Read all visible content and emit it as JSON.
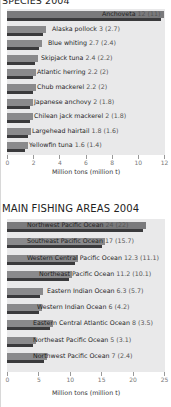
{
  "chart_data": [
    {
      "type": "bar",
      "orientation": "horizontal",
      "title": "SPECIES 2004",
      "xlabel": "Million tons (million t)",
      "ylabel": "",
      "xlim": [
        0,
        12
      ],
      "xticks": [
        0,
        2,
        4,
        6,
        8,
        10,
        12
      ],
      "grid": false,
      "categories": [
        "Anchoveta",
        "Alaska pollock",
        "Blue whiting",
        "Skipjack tuna",
        "Atlantic herring",
        "Chub mackerel",
        "Japanese anchovy",
        "Chilean jack mackerel",
        "Largehead hairtail",
        "Yellowfin tuna"
      ],
      "series": [
        {
          "name": "Million tons",
          "values": [
            12,
            3,
            2.7,
            2.4,
            2.2,
            2.2,
            2,
            2,
            1.8,
            1.6
          ]
        },
        {
          "name": "Million t (parenthetical)",
          "values": [
            11,
            2.7,
            2.4,
            2.2,
            2,
            2,
            1.8,
            1.8,
            1.6,
            1.4
          ]
        }
      ],
      "labels": [
        "Anchoveta 12 (11)",
        "Alaska pollock 3 (2.7)",
        "Blue whiting 2.7 (2.4)",
        "Skipjack tuna 2.4 (2.2)",
        "Atlantic herring 2.2 (2)",
        "Chub mackerel 2.2 (2)",
        "Japanese anchovy 2 (1.8)",
        "Chilean jack mackerel 2 (1.8)",
        "Largehead hairtail 1.8 (1.6)",
        "Yellowfin tuna 1.6 (1.4)"
      ]
    },
    {
      "type": "bar",
      "orientation": "horizontal",
      "title": "MAIN FISHING AREAS 2004",
      "xlabel": "Million tons (million t)",
      "ylabel": "",
      "xlim": [
        0,
        25
      ],
      "xticks": [
        0,
        5,
        10,
        15,
        20,
        25
      ],
      "grid": false,
      "categories": [
        "Northwest Pacific Ocean",
        "Southeast Pacific Ocean",
        "Western Central Pacific Ocean",
        "Northeast Pacific Ocean",
        "Eastern Indian Ocean",
        "Western Indian Ocean",
        "Eastern Central Atlantic Ocean",
        "Northeast Pacific Ocean",
        "Northwest Pacific Ocean"
      ],
      "series": [
        {
          "name": "Million tons",
          "values": [
            24,
            17,
            12.3,
            11.2,
            6.3,
            6,
            8,
            5,
            7
          ]
        },
        {
          "name": "Million t (parenthetical)",
          "values": [
            22,
            15.7,
            11.1,
            10.1,
            5.7,
            4.2,
            3.5,
            3.1,
            2.4
          ]
        }
      ],
      "labels": [
        "Northwest Pacific Ocean 24 (22)",
        "Southeast Pacific Ocean 17 (15.7)",
        "Western Central Pacific Ocean 12.3 (11.1)",
        "Northeast Pacific Ocean 11.2 (10.1)",
        "Eastern Indian Ocean 6.3 (5.7)",
        "Western Indian Ocean 6 (4.2)",
        "Eastern Central Atlantic Ocean 8 (3.5)",
        "Northeast Pacific Ocean 5 (3.1)",
        "Northwest Pacific Ocean 7 (2.4)"
      ]
    }
  ],
  "charts": {
    "species": {
      "title": "SPECIES 2004",
      "xlabel": "Million tons (million t)",
      "ticks": [
        "0",
        "2",
        "4",
        "6",
        "8",
        "10",
        "12"
      ],
      "rows": [
        {
          "name": "Anchoveta",
          "val": "12 (11)"
        },
        {
          "name": "Alaska pollock",
          "val": "3 (2.7)"
        },
        {
          "name": "Blue whiting",
          "val": "2.7 (2.4)"
        },
        {
          "name": "Skipjack tuna",
          "val": "2.4 (2.2)"
        },
        {
          "name": "Atlantic herring",
          "val": "2.2 (2)"
        },
        {
          "name": "Chub mackerel",
          "val": "2.2 (2)"
        },
        {
          "name": "Japanese anchovy",
          "val": "2 (1.8)"
        },
        {
          "name": "Chilean jack mackerel",
          "val": "2 (1.8)"
        },
        {
          "name": "Largehead hairtail",
          "val": "1.8 (1.6)"
        },
        {
          "name": "Yellowfin tuna",
          "val": "1.6 (1.4)"
        }
      ]
    },
    "areas": {
      "title": "MAIN FISHING AREAS 2004",
      "xlabel": "Million tons (million t)",
      "ticks": [
        "0",
        "5",
        "10",
        "15",
        "20",
        "25"
      ],
      "rows": [
        {
          "name": "Northwest Pacific Ocean",
          "val": "24 (22)"
        },
        {
          "name": "Southeast Pacific Ocean",
          "val": "17 (15.7)"
        },
        {
          "name": "Western Central Pacific Ocean",
          "val": "12.3 (11.1)"
        },
        {
          "name": "Northeast Pacific Ocean",
          "val": "11.2 (10.1)"
        },
        {
          "name": "Eastern Indian Ocean",
          "val": "6.3 (5.7)"
        },
        {
          "name": "Western Indian Ocean",
          "val": "6 (4.2)"
        },
        {
          "name": "Eastern Central Atlantic Ocean",
          "val": "8 (3.5)"
        },
        {
          "name": "Northeast Pacific Ocean",
          "val": "5 (3.1)"
        },
        {
          "name": "Northwest Pacific Ocean",
          "val": "7 (2.4)"
        }
      ]
    }
  }
}
